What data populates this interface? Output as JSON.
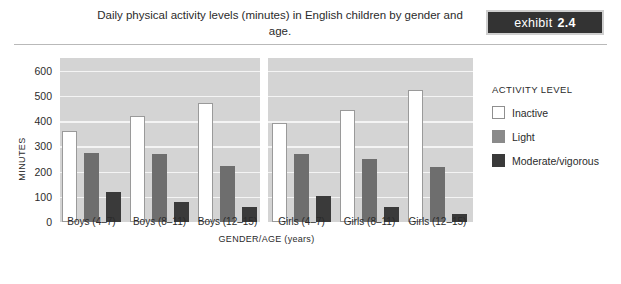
{
  "header": {
    "title": "Daily physical activity levels (minutes) in English children by gender and age.",
    "exhibit_word": "exhibit",
    "exhibit_number": "2.4"
  },
  "legend": {
    "title": "ACTIVITY LEVEL",
    "items": [
      {
        "label": "Inactive",
        "color": "#ffffff"
      },
      {
        "label": "Light",
        "color": "#8a8a8a"
      },
      {
        "label": "Moderate/vigorous",
        "color": "#3a3a3a"
      }
    ]
  },
  "axes": {
    "y_title": "MINUTES",
    "x_title": "GENDER/AGE (years)",
    "y_ticks": [
      "600",
      "500",
      "400",
      "300",
      "200",
      "100",
      "0"
    ]
  },
  "chart_data": {
    "type": "bar",
    "title": "Daily physical activity levels (minutes) in English children by gender and age.",
    "xlabel": "GENDER/AGE (years)",
    "ylabel": "MINUTES",
    "ylim": [
      0,
      650
    ],
    "yticks": [
      0,
      100,
      200,
      300,
      400,
      500,
      600
    ],
    "grid": true,
    "legend_position": "right",
    "legend_title": "ACTIVITY LEVEL",
    "categories": [
      "Boys (4–7)",
      "Boys (8–11)",
      "Boys (12–15)",
      "Girls (4–7)",
      "Girls (8–11)",
      "Girls (12–15)"
    ],
    "series": [
      {
        "name": "Inactive",
        "color": "#ffffff",
        "values": [
          362,
          420,
          470,
          392,
          443,
          525
        ]
      },
      {
        "name": "Light",
        "color": "#6e6e6e",
        "values": [
          272,
          268,
          222,
          268,
          250,
          218
        ]
      },
      {
        "name": "Moderate/vigorous",
        "color": "#3a3a3a",
        "values": [
          120,
          78,
          58,
          103,
          60,
          33
        ]
      }
    ]
  }
}
